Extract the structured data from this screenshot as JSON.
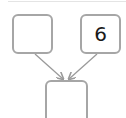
{
  "diagram": {
    "type": "number-bond",
    "boxes": {
      "left": {
        "value": ""
      },
      "right": {
        "value": "6"
      },
      "bottom": {
        "value": ""
      }
    },
    "colors": {
      "box_border": "#a6a6a6",
      "arrow": "#9a9a9a",
      "text": "#1a1a1a",
      "background": "#ffffff"
    }
  }
}
